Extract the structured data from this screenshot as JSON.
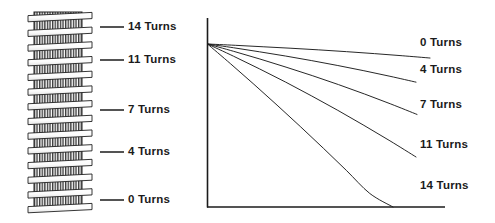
{
  "figure": {
    "ink_color": "#1b1b1b",
    "background_color": "#ffffff"
  },
  "coil_diagram": {
    "name": "wire-wound-threaded-shaft",
    "description": "Vertical threaded shaft with helical wire coil loops wound around it",
    "turn_labels": [
      {
        "text": "14 Turns",
        "value": 14,
        "leader_y": 27
      },
      {
        "text": "11 Turns",
        "value": 11,
        "leader_y": 60
      },
      {
        "text": "7 Turns",
        "value": 7,
        "leader_y": 110
      },
      {
        "text": "4 Turns",
        "value": 4,
        "leader_y": 152
      },
      {
        "text": "0 Turns",
        "value": 0,
        "leader_y": 200
      }
    ]
  },
  "chart_data": {
    "type": "line",
    "title": "",
    "xlabel": "",
    "ylabel": "",
    "grid": false,
    "legend_position": "right-inline",
    "axis": {
      "x_range_px": [
        207,
        445
      ],
      "y_range_px": [
        18,
        207
      ],
      "x_axis_visible": true,
      "y_axis_visible": true,
      "ticks": []
    },
    "origin_label": "common start point",
    "x": [
      0,
      0.125,
      0.25,
      0.375,
      0.5,
      0.625,
      0.75,
      0.875,
      1.0
    ],
    "series": [
      {
        "name": "0 Turns",
        "turns": 0,
        "values": [
          1.0,
          0.992,
          0.983,
          0.974,
          0.964,
          0.953,
          0.941,
          0.928,
          0.914
        ],
        "label_x_px": 420,
        "label_y_px": 43
      },
      {
        "name": "4 Turns",
        "turns": 4,
        "values": [
          1.0,
          0.977,
          0.952,
          0.926,
          0.898,
          0.868,
          0.836,
          0.802,
          0.766
        ],
        "label_x_px": 420,
        "label_y_px": 70
      },
      {
        "name": "7 Turns",
        "turns": 7,
        "values": [
          1.0,
          0.955,
          0.908,
          0.858,
          0.806,
          0.751,
          0.693,
          0.632,
          0.568
        ],
        "label_x_px": 420,
        "label_y_px": 105
      },
      {
        "name": "11 Turns",
        "turns": 11,
        "values": [
          1.0,
          0.925,
          0.847,
          0.766,
          0.681,
          0.593,
          0.501,
          0.406,
          0.307
        ],
        "label_x_px": 420,
        "label_y_px": 145
      },
      {
        "name": "14 Turns",
        "turns": 14,
        "values": [
          1.0,
          0.878,
          0.753,
          0.625,
          0.494,
          0.36,
          0.223,
          0.083,
          0.0
        ],
        "label_x_px": 420,
        "label_y_px": 186
      }
    ]
  }
}
